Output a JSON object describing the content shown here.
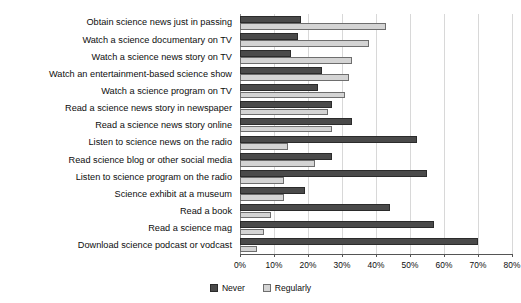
{
  "chart_data": {
    "type": "bar",
    "orientation": "horizontal",
    "title": "",
    "subtitle": "",
    "xlabel": "",
    "ylabel": "",
    "xlim": [
      0,
      80
    ],
    "grid": true,
    "legend_position": "bottom-center",
    "xticks": [
      "0%",
      "10%",
      "20%",
      "30%",
      "40%",
      "50%",
      "60%",
      "70%",
      "80%"
    ],
    "xtick_values": [
      0,
      10,
      20,
      30,
      40,
      50,
      60,
      70,
      80
    ],
    "categories": [
      "Obtain science news just in passing",
      "Watch a science documentary on TV",
      "Watch a science news story on TV",
      "Watch an entertainment-based science show",
      "Watch a science program on TV",
      "Read a science news story in newspaper",
      "Read a science news story online",
      "Listen to science news on the radio",
      "Read science blog or other social media",
      "Listen to science program on the radio",
      "Science exhibit at a museum",
      "Read a book",
      "Read a science mag",
      "Download science podcast or vodcast"
    ],
    "series": [
      {
        "name": "Never",
        "color": "#4a4a4a",
        "values": [
          18,
          17,
          15,
          24,
          23,
          27,
          33,
          52,
          27,
          55,
          19,
          44,
          57,
          70
        ]
      },
      {
        "name": "Regularly",
        "color": "#d4d4d4",
        "values": [
          43,
          38,
          33,
          32,
          31,
          26,
          27,
          14,
          22,
          13,
          13,
          9,
          7,
          5
        ]
      }
    ]
  },
  "legend": {
    "items": [
      {
        "label": "Never"
      },
      {
        "label": "Regularly"
      }
    ]
  },
  "colors": {
    "never": "#4a4a4a",
    "regularly": "#d4d4d4",
    "grid": "#d8d8d8",
    "axis": "#555555",
    "text": "#0d0d0d",
    "background": "#ffffff"
  }
}
